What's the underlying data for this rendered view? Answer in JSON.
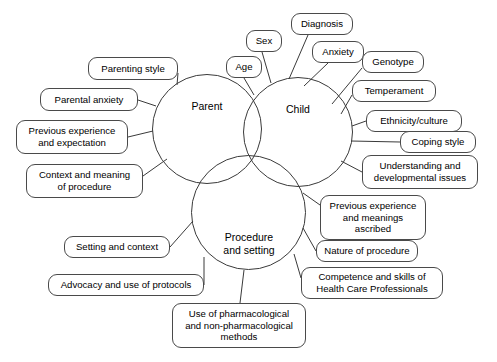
{
  "diagram": {
    "type": "venn-mind-map",
    "background_color": "#ffffff",
    "stroke_color": "#3a3a3a",
    "text_color": "#000000"
  },
  "circles": [
    {
      "id": "parent",
      "label": "Parent",
      "x": 152,
      "y": 74,
      "size": 110,
      "label_x": 172,
      "label_y": 100,
      "label_w": 70
    },
    {
      "id": "child",
      "label": "Child",
      "x": 243,
      "y": 77,
      "size": 110,
      "label_x": 263,
      "label_y": 103,
      "label_w": 70
    },
    {
      "id": "procedure",
      "label": "Procedure\nand setting",
      "x": 191,
      "y": 155,
      "size": 115,
      "label_x": 208,
      "label_y": 231,
      "label_w": 82
    }
  ],
  "nodes": [
    {
      "id": "parenting-style",
      "label": "Parenting style",
      "group": "parent",
      "x": 88,
      "y": 57,
      "w": 90,
      "h": 23,
      "from_x": 177,
      "from_y": 85,
      "to_x": 178,
      "to_y": 73
    },
    {
      "id": "parental-anxiety",
      "label": "Parental anxiety",
      "group": "parent",
      "x": 40,
      "y": 88,
      "w": 98,
      "h": 23,
      "from_x": 156,
      "from_y": 106,
      "to_x": 138,
      "to_y": 100
    },
    {
      "id": "previous-experience-expectation",
      "label": "Previous experience\nand expectation",
      "group": "parent",
      "x": 16,
      "y": 120,
      "w": 112,
      "h": 34,
      "from_x": 153,
      "from_y": 131,
      "to_x": 128,
      "to_y": 137
    },
    {
      "id": "context-meaning-procedure",
      "label": "Context and meaning\nof procedure",
      "group": "parent",
      "x": 26,
      "y": 164,
      "w": 117,
      "h": 34,
      "from_x": 167,
      "from_y": 159,
      "to_x": 143,
      "to_y": 176
    },
    {
      "id": "sex",
      "label": "Sex",
      "group": "child",
      "x": 246,
      "y": 30,
      "w": 36,
      "h": 22,
      "from_x": 271,
      "from_y": 83,
      "to_x": 262,
      "to_y": 52
    },
    {
      "id": "age",
      "label": "Age",
      "group": "child",
      "x": 226,
      "y": 56,
      "w": 36,
      "h": 22,
      "from_x": 254,
      "from_y": 95,
      "to_x": 244,
      "to_y": 78
    },
    {
      "id": "diagnosis",
      "label": "Diagnosis",
      "group": "child",
      "x": 291,
      "y": 13,
      "w": 62,
      "h": 22,
      "from_x": 289,
      "from_y": 79,
      "to_x": 308,
      "to_y": 35
    },
    {
      "id": "anxiety",
      "label": "Anxiety",
      "group": "child",
      "x": 312,
      "y": 41,
      "w": 52,
      "h": 22,
      "from_x": 304,
      "from_y": 86,
      "to_x": 328,
      "to_y": 63
    },
    {
      "id": "genotype",
      "label": "Genotype",
      "group": "child",
      "x": 362,
      "y": 51,
      "w": 62,
      "h": 22,
      "from_x": 332,
      "from_y": 104,
      "to_x": 362,
      "to_y": 68
    },
    {
      "id": "temperament",
      "label": "Temperament",
      "group": "child",
      "x": 352,
      "y": 80,
      "w": 84,
      "h": 22,
      "from_x": 341,
      "from_y": 114,
      "to_x": 352,
      "to_y": 95
    },
    {
      "id": "ethnicity-culture",
      "label": "Ethnicity/culture",
      "group": "child",
      "x": 366,
      "y": 110,
      "w": 96,
      "h": 22,
      "from_x": 352,
      "from_y": 126,
      "to_x": 366,
      "to_y": 121
    },
    {
      "id": "coping-style",
      "label": "Coping style",
      "group": "child",
      "x": 400,
      "y": 131,
      "w": 76,
      "h": 22,
      "from_x": 351,
      "from_y": 141,
      "to_x": 400,
      "to_y": 142
    },
    {
      "id": "understanding-developmental",
      "label": "Understanding and\ndevelopmental issues",
      "group": "child",
      "x": 362,
      "y": 155,
      "w": 116,
      "h": 34,
      "from_x": 341,
      "from_y": 161,
      "to_x": 362,
      "to_y": 172
    },
    {
      "id": "previous-experience-meanings",
      "label": "Previous experience\nand meanings\nascribed",
      "group": "procedure",
      "x": 320,
      "y": 195,
      "w": 106,
      "h": 45,
      "from_x": 303,
      "from_y": 193,
      "to_x": 320,
      "to_y": 205
    },
    {
      "id": "nature-of-procedure",
      "label": "Nature of procedure",
      "group": "procedure",
      "x": 316,
      "y": 240,
      "w": 102,
      "h": 22,
      "from_x": 303,
      "from_y": 228,
      "to_x": 316,
      "to_y": 251
    },
    {
      "id": "competence-skills-hcp",
      "label": "Competence and skills of\nHealth Care Professionals",
      "group": "procedure",
      "x": 301,
      "y": 267,
      "w": 142,
      "h": 32,
      "from_x": 294,
      "from_y": 254,
      "to_x": 301,
      "to_y": 278
    },
    {
      "id": "setting-and-context",
      "label": "Setting and context",
      "group": "procedure",
      "x": 64,
      "y": 236,
      "w": 106,
      "h": 22,
      "from_x": 193,
      "from_y": 221,
      "to_x": 170,
      "to_y": 247
    },
    {
      "id": "advocacy-use-protocols",
      "label": "Advocacy and use of protocols",
      "group": "procedure",
      "x": 48,
      "y": 274,
      "w": 156,
      "h": 22,
      "from_x": 204,
      "from_y": 257,
      "to_x": 204,
      "to_y": 285
    },
    {
      "id": "use-pharmacological-methods",
      "label": "Use of pharmacological\nand non-pharmacological\nmethods",
      "group": "procedure",
      "x": 172,
      "y": 303,
      "w": 134,
      "h": 45,
      "from_x": 244,
      "from_y": 270,
      "to_x": 240,
      "to_y": 303
    }
  ]
}
